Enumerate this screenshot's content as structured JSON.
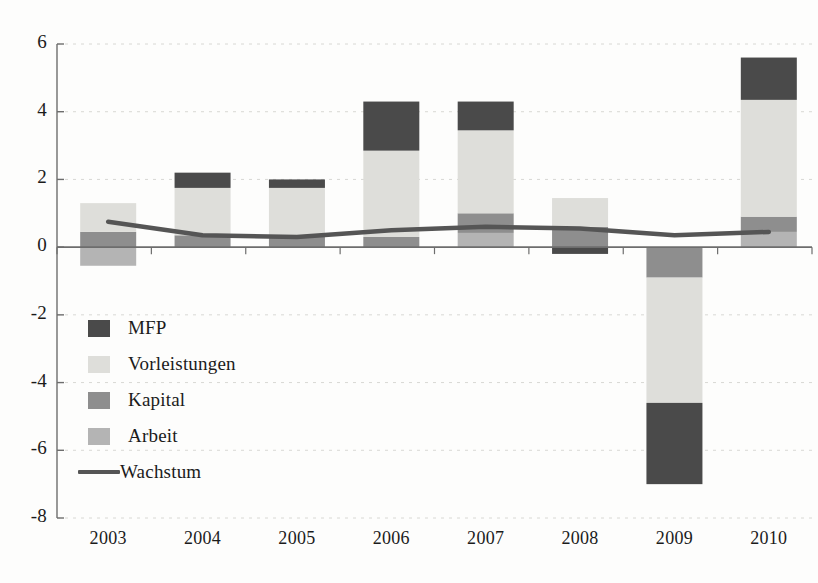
{
  "chart_data": {
    "type": "bar",
    "subtype": "stacked-bar-with-line",
    "title": "",
    "subtitle": "",
    "xlabel": "",
    "ylabel": "",
    "categories": [
      "2003",
      "2004",
      "2005",
      "2006",
      "2007",
      "2008",
      "2009",
      "2010"
    ],
    "xlim_labels": [
      "2003",
      "2010"
    ],
    "ylim": [
      -8,
      6
    ],
    "yticks": [
      6,
      4,
      2,
      0,
      -2,
      -4,
      -6,
      -8
    ],
    "ytick_labels": [
      "6",
      "4",
      "2",
      "0",
      "-2",
      "-4",
      "-6",
      "-8"
    ],
    "grid": true,
    "grid_axis": "y",
    "legend_position": "lower-left-inside",
    "series": [
      {
        "name": "MFP",
        "type": "bar-segment",
        "color": "#4a4a4a",
        "values": [
          0.0,
          0.45,
          0.25,
          1.45,
          0.85,
          -0.2,
          -2.4,
          1.25
        ]
      },
      {
        "name": "Vorleistungen",
        "type": "bar-segment",
        "color": "#dededa",
        "values": [
          0.85,
          1.4,
          1.45,
          2.55,
          2.45,
          0.85,
          -3.7,
          3.45
        ]
      },
      {
        "name": "Kapital",
        "type": "bar-segment",
        "color": "#8e8e8e",
        "values": [
          0.45,
          0.35,
          0.3,
          0.3,
          0.58,
          0.6,
          -0.9,
          0.45
        ]
      },
      {
        "name": "Arbeit",
        "type": "bar-segment",
        "color": "#b4b4b4",
        "values": [
          -0.55,
          0.0,
          0.0,
          0.0,
          0.42,
          0.0,
          0.0,
          0.45
        ]
      },
      {
        "name": "Wachstum",
        "type": "line",
        "color": "#555555",
        "values": [
          0.75,
          0.35,
          0.3,
          0.5,
          0.6,
          0.55,
          0.35,
          0.45
        ]
      }
    ],
    "bar_totals_positive": [
      1.3,
      2.2,
      2.0,
      4.3,
      4.3,
      1.45,
      0.0,
      5.6
    ],
    "bar_totals_negative": [
      -0.55,
      0.0,
      0.0,
      0.0,
      0.0,
      -0.2,
      -7.0,
      0.0
    ],
    "annotations": []
  },
  "legend": {
    "items": [
      {
        "label": "MFP",
        "kind": "swatch",
        "color": "#4a4a4a"
      },
      {
        "label": "Vorleistungen",
        "kind": "swatch",
        "color": "#dededa"
      },
      {
        "label": "Kapital",
        "kind": "swatch",
        "color": "#8e8e8e"
      },
      {
        "label": "Arbeit",
        "kind": "swatch",
        "color": "#b4b4b4"
      },
      {
        "label": "Wachstum",
        "kind": "line",
        "color": "#555555"
      }
    ]
  },
  "axes": {
    "y_labels": [
      "6",
      "4",
      "2",
      "0",
      "-2",
      "-4",
      "-6",
      "-8"
    ],
    "x_labels": [
      "2003",
      "2004",
      "2005",
      "2006",
      "2007",
      "2008",
      "2009",
      "2010"
    ]
  },
  "colors": {
    "mfp": "#4a4a4a",
    "vorleistungen": "#dededa",
    "kapital": "#8e8e8e",
    "arbeit": "#b4b4b4",
    "wachstum": "#555555",
    "axis": "#6d6d6d",
    "grid": "#d8d8d4",
    "background": "#fdfdfc",
    "text": "#1b1b1b"
  }
}
